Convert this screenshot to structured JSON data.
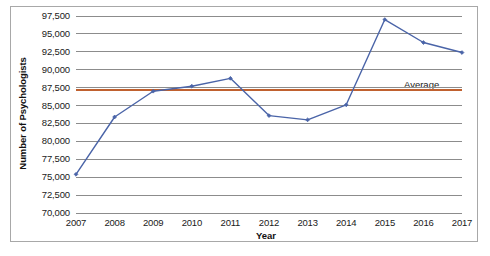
{
  "chart_data": {
    "type": "line",
    "title": "",
    "xlabel": "Year",
    "ylabel": "Number of Psychologists",
    "categories": [
      "2007",
      "2008",
      "2009",
      "2010",
      "2011",
      "2012",
      "2013",
      "2014",
      "2015",
      "2016",
      "2017"
    ],
    "x": [
      2007,
      2008,
      2009,
      2010,
      2011,
      2012,
      2013,
      2014,
      2015,
      2016,
      2017
    ],
    "series": [
      {
        "name": "Number of Psychologists",
        "color": "#4a64a8",
        "marker": "diamond",
        "values": [
          75400,
          83400,
          87000,
          87700,
          88800,
          83600,
          83000,
          85100,
          97000,
          93800,
          92400
        ]
      }
    ],
    "reference_lines": [
      {
        "name": "Average",
        "label": "Average",
        "value": 87200,
        "color": "#c0612f",
        "orientation": "horizontal"
      }
    ],
    "ylim": [
      70000,
      97500
    ],
    "ytick_values": [
      70000,
      72500,
      75000,
      77500,
      80000,
      82500,
      85000,
      87500,
      90000,
      92500,
      95000,
      97500
    ],
    "ytick_labels": [
      "70,000",
      "72,500",
      "75,000",
      "77,500",
      "80,000",
      "82,500",
      "85,000",
      "87,500",
      "90,000",
      "92,500",
      "95,000",
      "97,500"
    ],
    "grid": true,
    "grid_orientation": "horizontal",
    "grid_color": "#8c8c8c",
    "legend": false,
    "background": "#ffffff",
    "border_color": "#a8a8a8"
  }
}
